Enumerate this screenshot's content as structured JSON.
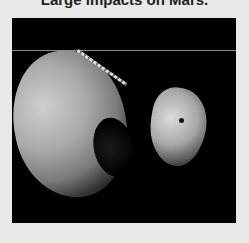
{
  "heading": {
    "text": "Large impacts on Mars."
  },
  "image": {
    "subject": "Phobos and Deimos, moons of Mars",
    "background_color": "#000000",
    "page_background": "#e9e9e9"
  }
}
